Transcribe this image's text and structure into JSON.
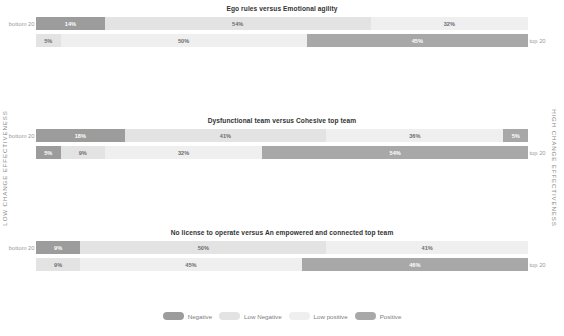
{
  "axis": {
    "left_label": "LOW CHANGE EFFECTIVENESS",
    "right_label": "HIGH CHANGE EFFECTIVENESS"
  },
  "row_labels": {
    "bottom": "bottom 20",
    "top": "top 20"
  },
  "legend": {
    "items": [
      {
        "label": "Negative",
        "color": "#9c9c9c"
      },
      {
        "label": "Low Negative",
        "color": "#e3e3e3"
      },
      {
        "label": "Low positive",
        "color": "#efefef"
      },
      {
        "label": "Positive",
        "color": "#a8a8a8"
      }
    ]
  },
  "colors": {
    "negative": "#9c9c9c",
    "low_negative": "#e3e3e3",
    "low_positive": "#efefef",
    "positive": "#a8a8a8",
    "title": "#333333",
    "label": "#9b9b9b",
    "axis": "#8a8a8a"
  },
  "chart_data": {
    "type": "bar",
    "subtype": "diverging-stacked-bar",
    "title": "",
    "xlabel": "",
    "ylabel": "",
    "axis_left": "LOW CHANGE EFFECTIVENESS",
    "axis_right": "HIGH CHANGE EFFECTIVENESS",
    "categories": [
      "Negative",
      "Low Negative",
      "Low positive",
      "Positive"
    ],
    "legend_position": "bottom",
    "grid": false,
    "xlim": [
      0,
      100
    ],
    "value_unit": "%",
    "panels": [
      {
        "title": "Ego rules versus Emotional agility",
        "rows": [
          {
            "label": "bottom 20",
            "label_side": "left",
            "align": "left",
            "values": [
              14,
              54,
              32,
              0
            ],
            "labels": [
              "14%",
              "54%",
              "32%",
              ""
            ]
          },
          {
            "label": "top 20",
            "label_side": "right",
            "align": "right",
            "values": [
              0,
              5,
              50,
              45
            ],
            "labels": [
              "",
              "5%",
              "50%",
              "45%"
            ]
          }
        ]
      },
      {
        "title": "Dysfunctional team versus Cohesive top team",
        "rows": [
          {
            "label": "bottom 20",
            "label_side": "left",
            "align": "left",
            "values": [
              18,
              41,
              36,
              5
            ],
            "labels": [
              "18%",
              "41%",
              "36%",
              "5%"
            ]
          },
          {
            "label": "top 20",
            "label_side": "right",
            "align": "right",
            "values": [
              5,
              9,
              32,
              54
            ],
            "labels": [
              "5%",
              "9%",
              "32%",
              "54%"
            ]
          }
        ]
      },
      {
        "title": "No license to operate versus An empowered and connected top team",
        "rows": [
          {
            "label": "bottom 20",
            "label_side": "left",
            "align": "left",
            "values": [
              9,
              50,
              41,
              0
            ],
            "labels": [
              "9%",
              "50%",
              "41%",
              ""
            ]
          },
          {
            "label": "top 20",
            "label_side": "right",
            "align": "right",
            "values": [
              0,
              9,
              45,
              46
            ],
            "labels": [
              "",
              "9%",
              "45%",
              "46%"
            ]
          }
        ]
      },
      {
        "title": "No drive for change versus Divine discontent",
        "rows": [
          {
            "label": "bottom 20",
            "label_side": "left",
            "align": "left",
            "values": [
              18,
              32,
              45,
              5
            ],
            "labels": [
              "18%",
              "32%",
              "45%",
              "5%"
            ]
          },
          {
            "label": "top 20",
            "label_side": "right",
            "align": "right",
            "values": [
              5,
              18,
              50,
              27
            ],
            "labels": [
              "5%",
              "18%",
              "50%",
              "27%"
            ]
          }
        ]
      },
      {
        "title": "Goals without ambition versus A compelling aspiration",
        "rows": [
          {
            "label": "bottom 20",
            "label_side": "left",
            "align": "left",
            "values": [
              14,
              63,
              14,
              9
            ],
            "labels": [
              "14%",
              "63%",
              "14%",
              "9%"
            ]
          },
          {
            "label": "top 20",
            "label_side": "right",
            "align": "right",
            "values": [
              0,
              5,
              41,
              54
            ],
            "labels": [
              "",
              "5%",
              "41%",
              "54%"
            ]
          }
        ]
      }
    ]
  }
}
